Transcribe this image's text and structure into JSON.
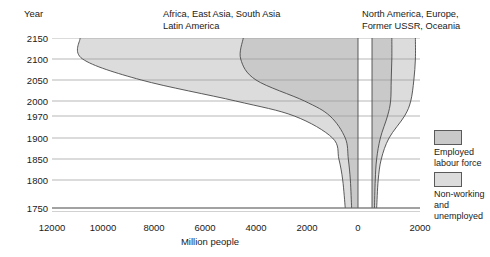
{
  "axis": {
    "y_title": "Year",
    "y_ticks": [
      2150,
      2100,
      2050,
      2000,
      1970,
      1900,
      1850,
      1800,
      1750
    ],
    "x_title": "Million people",
    "x_ticks_left": [
      12000,
      10000,
      8000,
      6000,
      4000,
      2000,
      0
    ],
    "x_ticks_right": [
      2000
    ]
  },
  "panels": {
    "left_title_line1": "Africa, East Asia, South Asia",
    "left_title_line2": "Latin America",
    "right_title_line1": "North America, Europe,",
    "right_title_line2": "Former USSR, Oceania"
  },
  "legend": {
    "employed_label_line1": "Employed",
    "employed_label_line2": "labour force",
    "nonworking_label_line1": "Non-working",
    "nonworking_label_line2": "and",
    "nonworking_label_line3": "unemployed",
    "employed_color": "#c9c9c9",
    "nonworking_color": "#dcdcdc"
  },
  "chart_data": {
    "type": "area",
    "title": "",
    "xlabel": "Million people",
    "ylabel": "Year",
    "grid": true,
    "legend_position": "right",
    "orientation": "horizontal-population-pyramid",
    "x_axis": {
      "left_panel_range": [
        12000,
        0
      ],
      "right_panel_range": [
        0,
        2000
      ],
      "units": "million people",
      "note": "Left panel reads right-to-left from 0 at centre out to 12000; right panel reads left-to-right from 0 to 2000"
    },
    "y_axis": {
      "ticks": [
        1750,
        1800,
        1850,
        1900,
        1970,
        2000,
        2050,
        2100,
        2150
      ],
      "note": "Non-linear year scale; spacing compresses toward future dates"
    },
    "series": [
      {
        "name": "Africa, East Asia, South Asia, Latin America - total population",
        "panel": "left",
        "values_by_year": {
          "1750": 500,
          "1800": 600,
          "1850": 750,
          "1900": 1000,
          "1970": 2500,
          "2000": 4800,
          "2050": 8500,
          "2100": 10800,
          "2150": 10900
        }
      },
      {
        "name": "Africa, East Asia, South Asia, Latin America - employed labour force",
        "panel": "left",
        "values_by_year": {
          "1750": 250,
          "1800": 300,
          "1850": 380,
          "1900": 500,
          "1970": 1100,
          "2000": 2100,
          "2050": 4000,
          "2100": 4600,
          "2150": 4500
        }
      },
      {
        "name": "North America, Europe, Former USSR, Oceania - total population",
        "panel": "right",
        "values_by_year": {
          "1750": 150,
          "1800": 200,
          "1850": 300,
          "1900": 550,
          "1970": 1050,
          "2000": 1250,
          "2050": 1350,
          "2100": 1400,
          "2150": 1400
        }
      },
      {
        "name": "North America, Europe, Former USSR, Oceania - employed labour force",
        "panel": "right",
        "values_by_year": {
          "1750": 80,
          "1800": 105,
          "1850": 150,
          "1900": 270,
          "1970": 500,
          "2000": 600,
          "2050": 620,
          "2100": 640,
          "2150": 640
        }
      }
    ]
  }
}
